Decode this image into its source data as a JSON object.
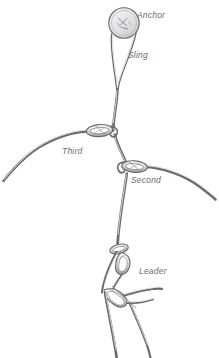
{
  "illustration": {
    "title": "Climbing belay anchor system",
    "background_color": "#ffffff",
    "line_color": "#6b6b6e",
    "shade_color": "#bdbdc1",
    "label_color": "#6e6e70",
    "style": "grayscale technical line drawing"
  },
  "labels": {
    "anchor": "Anchor",
    "sling": "Sling",
    "third": "Third",
    "second": "Second",
    "leader": "Leader"
  },
  "components": [
    {
      "name": "anchor",
      "label": "Anchor",
      "icon": "anchor-disc-icon",
      "shape": "circular disc with interior scratch marks",
      "center": [
        124,
        23
      ],
      "radius": 15
    },
    {
      "name": "sling",
      "label": "Sling",
      "icon": "sling-loop-icon",
      "shape": "long narrow loop tapering from anchor down to knot",
      "top": [
        124,
        30
      ],
      "bottom": [
        117,
        88
      ]
    },
    {
      "name": "third",
      "label": "Third",
      "icon": "carabiner-icon",
      "shape": "oval carabiner clipped on rope with rope arcing left",
      "position": [
        99,
        131
      ],
      "rope_end": [
        3,
        181
      ]
    },
    {
      "name": "second",
      "label": "Second",
      "icon": "carabiner-icon",
      "shape": "oval carabiner clipped on rope with rope arcing right",
      "position": [
        134,
        167
      ],
      "rope_end": [
        215,
        199
      ]
    },
    {
      "name": "leader",
      "label": "Leader",
      "icon": "carabiner-cluster-icon",
      "shape": "cluster of carabiners and belay device with rope strands",
      "position": [
        124,
        262
      ],
      "rope_ends": [
        [
          116,
          358
        ],
        [
          150,
          358
        ]
      ]
    }
  ]
}
